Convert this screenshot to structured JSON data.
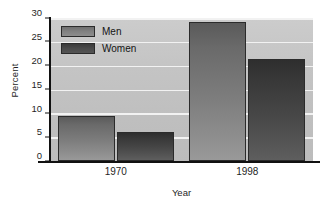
{
  "chart_data": {
    "type": "bar",
    "title": "",
    "subtitle": "",
    "xlabel": "Year",
    "ylabel": "Percent",
    "categories": [
      "1970",
      "1998"
    ],
    "series": [
      {
        "name": "Men",
        "values": [
          9.4,
          29.2
        ],
        "color": "#7d7d7d"
      },
      {
        "name": "Women",
        "values": [
          6.1,
          21.5
        ],
        "color": "#434343"
      }
    ],
    "ylim": [
      0,
      30
    ],
    "yticks": [
      0,
      5,
      10,
      15,
      20,
      25,
      30
    ],
    "ytick_labels": [
      "0",
      "5",
      "10",
      "15",
      "20",
      "25",
      "30"
    ],
    "grid": "horizontal",
    "legend_position": "top-left-inside",
    "plot_background": "#c4c4c4",
    "gridline_color": "#f2f2f2",
    "axis_color": "#111111"
  },
  "legend": {
    "items": [
      {
        "label": "Men"
      },
      {
        "label": "Women"
      }
    ]
  },
  "axes": {
    "y_title": "Percent",
    "x_title": "Year"
  }
}
